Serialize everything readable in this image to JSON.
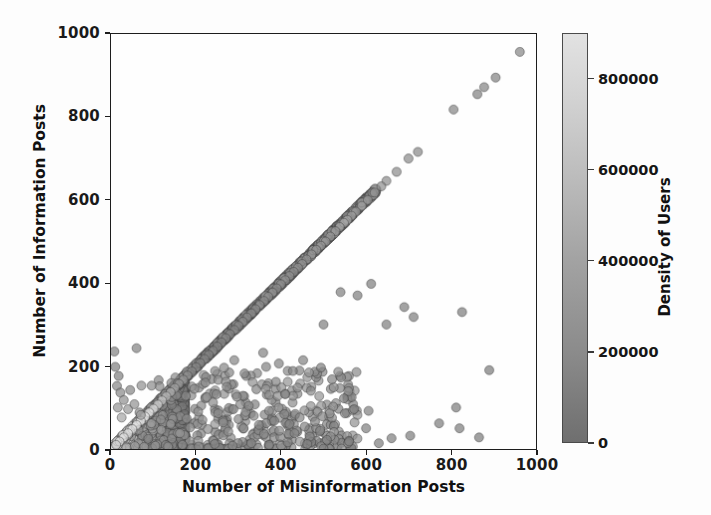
{
  "chart_data": {
    "type": "scatter",
    "title": "",
    "xlabel": "Number of Misinformation Posts",
    "ylabel": "Number of Information Posts",
    "xlim": [
      0,
      1000
    ],
    "ylim": [
      0,
      1000
    ],
    "xticks": [
      0,
      200,
      400,
      600,
      800,
      1000
    ],
    "yticks": [
      0,
      200,
      400,
      600,
      800,
      1000
    ],
    "grid": false,
    "legend": null,
    "colorbar": {
      "label": "Density of Users",
      "ticks": [
        0,
        200000,
        400000,
        600000,
        800000
      ],
      "tick_labels": [
        "0",
        "200000",
        "400000",
        "600000",
        "800000"
      ],
      "vmin": 0,
      "vmax": 900000,
      "colormap": "grayscale-dark-to-light",
      "low_color": "#6f6f6f",
      "high_color": "#e8e8e8",
      "position": "right"
    },
    "marker": {
      "shape": "circle",
      "size": 9,
      "opacity": 0.72,
      "edge_color": "#3a3a3a"
    },
    "points": [
      {
        "x": 962,
        "y": 957,
        "c": 200000
      },
      {
        "x": 905,
        "y": 895,
        "c": 170000
      },
      {
        "x": 878,
        "y": 872,
        "c": 180000
      },
      {
        "x": 862,
        "y": 855,
        "c": 160000
      },
      {
        "x": 806,
        "y": 818,
        "c": 190000
      },
      {
        "x": 722,
        "y": 716,
        "c": 210000
      },
      {
        "x": 700,
        "y": 700,
        "c": 230000
      },
      {
        "x": 672,
        "y": 668,
        "c": 250000
      },
      {
        "x": 648,
        "y": 646,
        "c": 240000
      },
      {
        "x": 636,
        "y": 633,
        "c": 260000
      },
      {
        "x": 620,
        "y": 618,
        "c": 300000
      },
      {
        "x": 604,
        "y": 600,
        "c": 330000
      },
      {
        "x": 590,
        "y": 586,
        "c": 350000
      },
      {
        "x": 576,
        "y": 572,
        "c": 310000
      },
      {
        "x": 566,
        "y": 562,
        "c": 360000
      },
      {
        "x": 556,
        "y": 552,
        "c": 400000
      },
      {
        "x": 548,
        "y": 545,
        "c": 420000
      },
      {
        "x": 538,
        "y": 535,
        "c": 380000
      },
      {
        "x": 528,
        "y": 525,
        "c": 330000
      },
      {
        "x": 516,
        "y": 512,
        "c": 300000
      },
      {
        "x": 505,
        "y": 500,
        "c": 290000
      },
      {
        "x": 494,
        "y": 490,
        "c": 280000
      },
      {
        "x": 483,
        "y": 480,
        "c": 270000
      },
      {
        "x": 472,
        "y": 469,
        "c": 265000
      },
      {
        "x": 460,
        "y": 457,
        "c": 260000
      },
      {
        "x": 450,
        "y": 446,
        "c": 255000
      },
      {
        "x": 440,
        "y": 437,
        "c": 250000
      },
      {
        "x": 430,
        "y": 427,
        "c": 245000
      },
      {
        "x": 420,
        "y": 417,
        "c": 240000
      },
      {
        "x": 410,
        "y": 407,
        "c": 235000
      },
      {
        "x": 400,
        "y": 397,
        "c": 230000
      },
      {
        "x": 390,
        "y": 387,
        "c": 225000
      },
      {
        "x": 380,
        "y": 377,
        "c": 220000
      },
      {
        "x": 370,
        "y": 367,
        "c": 215000
      },
      {
        "x": 360,
        "y": 357,
        "c": 210000
      },
      {
        "x": 350,
        "y": 347,
        "c": 205000
      },
      {
        "x": 340,
        "y": 337,
        "c": 200000
      },
      {
        "x": 330,
        "y": 327,
        "c": 195000
      },
      {
        "x": 320,
        "y": 317,
        "c": 190000
      },
      {
        "x": 310,
        "y": 307,
        "c": 185000
      },
      {
        "x": 300,
        "y": 297,
        "c": 180000
      },
      {
        "x": 290,
        "y": 287,
        "c": 175000
      },
      {
        "x": 280,
        "y": 277,
        "c": 170000
      },
      {
        "x": 270,
        "y": 267,
        "c": 165000
      },
      {
        "x": 260,
        "y": 257,
        "c": 160000
      },
      {
        "x": 250,
        "y": 247,
        "c": 155000
      },
      {
        "x": 240,
        "y": 237,
        "c": 150000
      },
      {
        "x": 230,
        "y": 227,
        "c": 150000
      },
      {
        "x": 220,
        "y": 217,
        "c": 160000
      },
      {
        "x": 210,
        "y": 207,
        "c": 170000
      },
      {
        "x": 200,
        "y": 197,
        "c": 185000
      },
      {
        "x": 190,
        "y": 187,
        "c": 200000
      },
      {
        "x": 180,
        "y": 177,
        "c": 230000
      },
      {
        "x": 170,
        "y": 167,
        "c": 270000
      },
      {
        "x": 160,
        "y": 157,
        "c": 320000
      },
      {
        "x": 150,
        "y": 147,
        "c": 390000
      },
      {
        "x": 140,
        "y": 137,
        "c": 470000
      },
      {
        "x": 130,
        "y": 127,
        "c": 560000
      },
      {
        "x": 120,
        "y": 117,
        "c": 650000
      },
      {
        "x": 110,
        "y": 107,
        "c": 720000
      },
      {
        "x": 100,
        "y": 97,
        "c": 790000
      },
      {
        "x": 90,
        "y": 88,
        "c": 840000
      },
      {
        "x": 80,
        "y": 78,
        "c": 870000
      },
      {
        "x": 70,
        "y": 68,
        "c": 890000
      },
      {
        "x": 60,
        "y": 58,
        "c": 880000
      },
      {
        "x": 50,
        "y": 48,
        "c": 860000
      },
      {
        "x": 40,
        "y": 38,
        "c": 830000
      },
      {
        "x": 30,
        "y": 28,
        "c": 800000
      },
      {
        "x": 20,
        "y": 18,
        "c": 760000
      },
      {
        "x": 12,
        "y": 10,
        "c": 700000
      },
      {
        "x": 8,
        "y": 235,
        "c": 180000
      },
      {
        "x": 10,
        "y": 198,
        "c": 160000
      },
      {
        "x": 18,
        "y": 176,
        "c": 150000
      },
      {
        "x": 60,
        "y": 243,
        "c": 170000
      },
      {
        "x": 14,
        "y": 152,
        "c": 200000
      },
      {
        "x": 22,
        "y": 136,
        "c": 210000
      },
      {
        "x": 45,
        "y": 142,
        "c": 190000
      },
      {
        "x": 30,
        "y": 118,
        "c": 260000
      },
      {
        "x": 16,
        "y": 100,
        "c": 300000
      },
      {
        "x": 40,
        "y": 96,
        "c": 330000
      },
      {
        "x": 55,
        "y": 108,
        "c": 280000
      },
      {
        "x": 25,
        "y": 76,
        "c": 420000
      },
      {
        "x": 70,
        "y": 82,
        "c": 400000
      },
      {
        "x": 95,
        "y": 62,
        "c": 380000
      },
      {
        "x": 118,
        "y": 46,
        "c": 360000
      },
      {
        "x": 140,
        "y": 60,
        "c": 300000
      },
      {
        "x": 162,
        "y": 38,
        "c": 320000
      },
      {
        "x": 186,
        "y": 52,
        "c": 280000
      },
      {
        "x": 205,
        "y": 90,
        "c": 250000
      },
      {
        "x": 215,
        "y": 70,
        "c": 245000
      },
      {
        "x": 228,
        "y": 48,
        "c": 255000
      },
      {
        "x": 240,
        "y": 112,
        "c": 220000
      },
      {
        "x": 252,
        "y": 86,
        "c": 215000
      },
      {
        "x": 264,
        "y": 64,
        "c": 230000
      },
      {
        "x": 276,
        "y": 42,
        "c": 240000
      },
      {
        "x": 288,
        "y": 96,
        "c": 210000
      },
      {
        "x": 300,
        "y": 72,
        "c": 205000
      },
      {
        "x": 312,
        "y": 50,
        "c": 215000
      },
      {
        "x": 324,
        "y": 104,
        "c": 195000
      },
      {
        "x": 336,
        "y": 80,
        "c": 200000
      },
      {
        "x": 348,
        "y": 58,
        "c": 205000
      },
      {
        "x": 360,
        "y": 36,
        "c": 210000
      },
      {
        "x": 372,
        "y": 92,
        "c": 190000
      },
      {
        "x": 384,
        "y": 68,
        "c": 195000
      },
      {
        "x": 396,
        "y": 44,
        "c": 200000
      },
      {
        "x": 408,
        "y": 84,
        "c": 185000
      },
      {
        "x": 420,
        "y": 60,
        "c": 190000
      },
      {
        "x": 432,
        "y": 38,
        "c": 195000
      },
      {
        "x": 444,
        "y": 76,
        "c": 180000
      },
      {
        "x": 456,
        "y": 54,
        "c": 185000
      },
      {
        "x": 468,
        "y": 30,
        "c": 190000
      },
      {
        "x": 480,
        "y": 66,
        "c": 175000
      },
      {
        "x": 492,
        "y": 44,
        "c": 180000
      },
      {
        "x": 176,
        "y": 128,
        "c": 230000
      },
      {
        "x": 196,
        "y": 145,
        "c": 215000
      },
      {
        "x": 222,
        "y": 160,
        "c": 205000
      },
      {
        "x": 248,
        "y": 132,
        "c": 200000
      },
      {
        "x": 272,
        "y": 150,
        "c": 195000
      },
      {
        "x": 296,
        "y": 126,
        "c": 190000
      },
      {
        "x": 318,
        "y": 176,
        "c": 185000
      },
      {
        "x": 342,
        "y": 144,
        "c": 180000
      },
      {
        "x": 365,
        "y": 198,
        "c": 175000
      },
      {
        "x": 388,
        "y": 162,
        "c": 178000
      },
      {
        "x": 410,
        "y": 132,
        "c": 182000
      },
      {
        "x": 266,
        "y": 196,
        "c": 200000
      },
      {
        "x": 290,
        "y": 214,
        "c": 190000
      },
      {
        "x": 314,
        "y": 182,
        "c": 188000
      },
      {
        "x": 358,
        "y": 232,
        "c": 170000
      },
      {
        "x": 395,
        "y": 206,
        "c": 172000
      },
      {
        "x": 428,
        "y": 188,
        "c": 168000
      },
      {
        "x": 452,
        "y": 214,
        "c": 165000
      },
      {
        "x": 494,
        "y": 196,
        "c": 160000
      },
      {
        "x": 520,
        "y": 168,
        "c": 162000
      },
      {
        "x": 548,
        "y": 122,
        "c": 158000
      },
      {
        "x": 572,
        "y": 96,
        "c": 155000
      },
      {
        "x": 600,
        "y": 50,
        "c": 150000
      },
      {
        "x": 606,
        "y": 92,
        "c": 152000
      },
      {
        "x": 612,
        "y": 398,
        "c": 145000
      },
      {
        "x": 580,
        "y": 370,
        "c": 148000
      },
      {
        "x": 540,
        "y": 378,
        "c": 152000
      },
      {
        "x": 500,
        "y": 300,
        "c": 156000
      },
      {
        "x": 648,
        "y": 300,
        "c": 140000
      },
      {
        "x": 690,
        "y": 342,
        "c": 138000
      },
      {
        "x": 712,
        "y": 318,
        "c": 136000
      },
      {
        "x": 826,
        "y": 330,
        "c": 130000
      },
      {
        "x": 890,
        "y": 190,
        "c": 126000
      },
      {
        "x": 772,
        "y": 62,
        "c": 132000
      },
      {
        "x": 812,
        "y": 100,
        "c": 128000
      },
      {
        "x": 820,
        "y": 50,
        "c": 130000
      },
      {
        "x": 866,
        "y": 28,
        "c": 124000
      },
      {
        "x": 704,
        "y": 32,
        "c": 134000
      },
      {
        "x": 660,
        "y": 26,
        "c": 136000
      },
      {
        "x": 630,
        "y": 14,
        "c": 140000
      },
      {
        "x": 560,
        "y": 18,
        "c": 148000
      },
      {
        "x": 508,
        "y": 22,
        "c": 152000
      },
      {
        "x": 462,
        "y": 12,
        "c": 158000
      },
      {
        "x": 416,
        "y": 16,
        "c": 164000
      },
      {
        "x": 372,
        "y": 10,
        "c": 170000
      },
      {
        "x": 330,
        "y": 14,
        "c": 178000
      },
      {
        "x": 286,
        "y": 8,
        "c": 186000
      },
      {
        "x": 244,
        "y": 12,
        "c": 196000
      },
      {
        "x": 206,
        "y": 6,
        "c": 208000
      },
      {
        "x": 168,
        "y": 10,
        "c": 226000
      },
      {
        "x": 134,
        "y": 6,
        "c": 250000
      },
      {
        "x": 104,
        "y": 8,
        "c": 280000
      },
      {
        "x": 78,
        "y": 5,
        "c": 320000
      },
      {
        "x": 56,
        "y": 7,
        "c": 380000
      },
      {
        "x": 36,
        "y": 4,
        "c": 450000
      }
    ]
  }
}
